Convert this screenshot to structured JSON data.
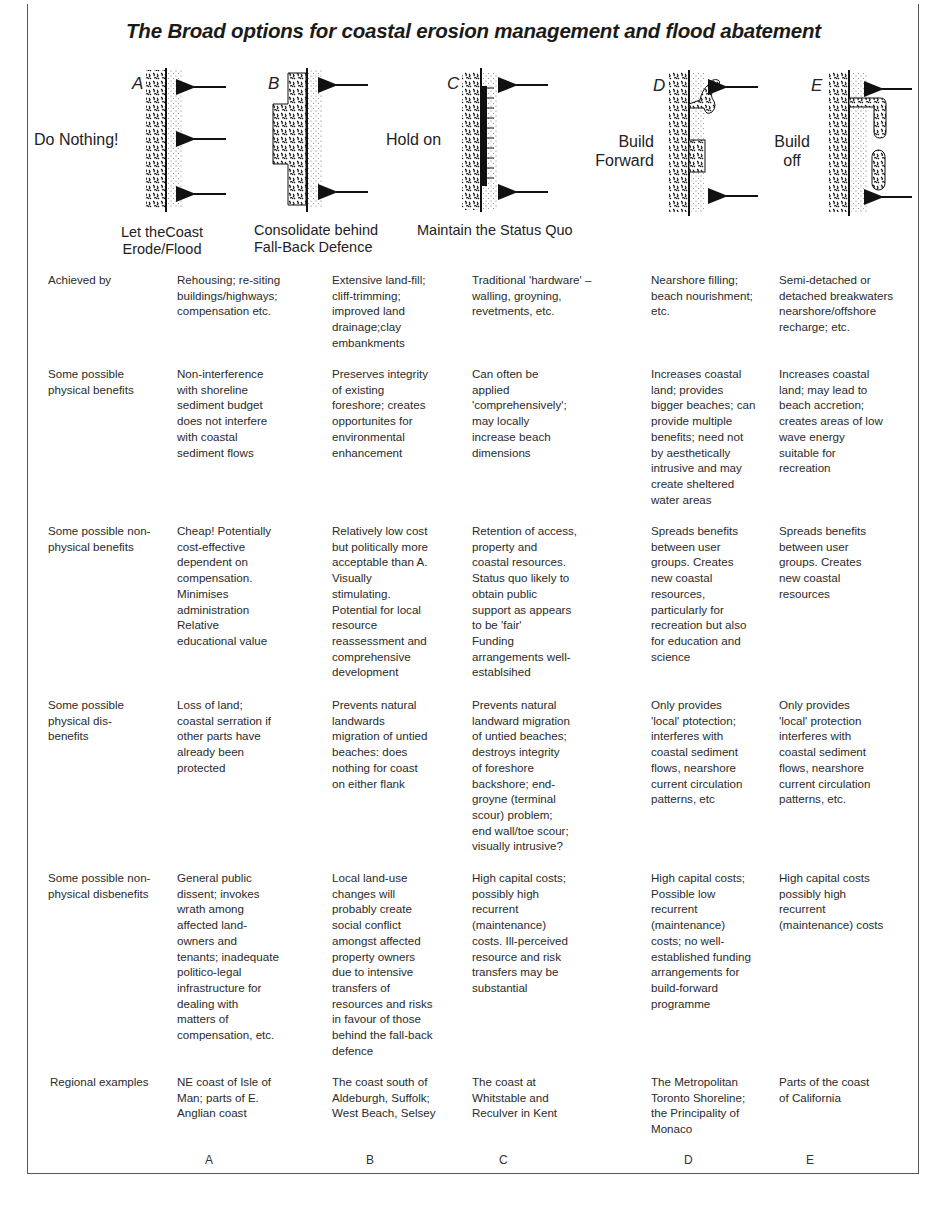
{
  "title": "The Broad options for coastal erosion management and flood abatement",
  "diagrams": [
    {
      "letter": "A",
      "side_label": "Do Nothing!",
      "caption": "Let theCoast\nErode/Flood"
    },
    {
      "letter": "B",
      "side_label": "",
      "caption": "Consolidate behind\nFall-Back Defence"
    },
    {
      "letter": "C",
      "side_label": "Hold on",
      "caption": "Maintain the Status Quo"
    },
    {
      "letter": "D",
      "side_label": "Build\nForward",
      "caption": ""
    },
    {
      "letter": "E",
      "side_label": "Build\noff",
      "caption": ""
    }
  ],
  "table": {
    "rows": [
      {
        "label": "Achieved by",
        "cells": [
          "Rehousing; re-siting\nbuildings/highways;\ncompensation etc.",
          "Extensive land-fill;\ncliff-trimming;\nimproved land\ndrainage;clay\nembankments",
          "Traditional 'hardware' –\nwalling, groyning,\nrevetments, etc.",
          "Nearshore filling;\nbeach nourishment;\netc.",
          "Semi-detached or\ndetached breakwaters\nnearshore/offshore\nrecharge; etc."
        ]
      },
      {
        "label": "Some possible\nphysical benefits",
        "cells": [
          "Non-interference\nwith shoreline\nsediment budget\ndoes not interfere\nwith coastal\nsediment flows",
          "Preserves integrity\nof existing\nforeshore; creates\nopportunites for\nenvironmental\nenhancement",
          "Can often be\napplied\n'comprehensively';\nmay locally\nincrease beach\ndimensions",
          "Increases coastal\nland; provides\nbigger beaches; can\nprovide multiple\nbenefits; need not\nby aesthetically\nintrusive and may\ncreate sheltered\nwater areas",
          "Increases coastal\nland; may lead to\nbeach accretion;\ncreates areas of  low\nwave energy\nsuitable for\nrecreation"
        ]
      },
      {
        "label": "Some possible non-\nphysical benefits",
        "cells": [
          "Cheap! Potentially\ncost-effective\ndependent on\ncompensation.\nMinimises\nadministration\nRelative\neducational value",
          "Relatively low cost\nbut politically more\nacceptable than A.\nVisually\nstimulating.\nPotential for local\nresource\nreassessment and\ncomprehensive\ndevelopment",
          "Retention of access,\nproperty and\ncoastal resources.\nStatus quo likely to\nobtain public\nsupport as appears\nto be 'fair'\nFunding\narrangements well-\nestablsihed",
          "Spreads benefits\nbetween user\ngroups. Creates\nnew coastal\nresources,\nparticularly for\nrecreation but also\nfor education and\nscience",
          "Spreads benefits\nbetween user\ngroups. Creates\nnew coastal\nresources"
        ]
      },
      {
        "label": "Some possible\nphysical dis-\nbenefits",
        "cells": [
          "Loss of land;\ncoastal serration if\nother parts have\nalready been\nprotected",
          "Prevents natural\nlandwards\nmigration of untied\nbeaches: does\nnothing for coast\non either flank",
          "Prevents natural\nlandward migration\nof untied beaches;\ndestroys integrity\nof foreshore\nbackshore; end-\ngroyne (terminal\nscour) problem;\nend wall/toe scour;\nvisually intrusive?",
          "Only provides\n'local' ptotection;\ninterferes with\ncoastal sediment\nflows, nearshore\ncurrent circulation\npatterns, etc",
          "Only provides\n'local' protection\ninterferes with\ncoastal sediment\nflows, nearshore\ncurrent circulation\npatterns, etc."
        ]
      },
      {
        "label": "Some possible non-\nphysical disbenefits",
        "cells": [
          "General public\ndissent; invokes\nwrath among\naffected land-\nowners and\ntenants; inadequate\npolitico-legal\ninfrastructure for\ndealing with\nmatters of\ncompensation, etc.",
          "Local land-use\nchanges will\nprobably create\nsocial conflict\namongst affected\nproperty owners\ndue to intensive\ntransfers of\nresources and risks\nin favour of those\nbehind the fall-back\ndefence",
          "High capital costs;\npossibly high\nrecurrent\n(maintenance)\ncosts. Ill-perceived\nresource and risk\ntransfers may be\nsubstantial",
          "High capital costs;\nPossible low\nrecurrent\n(maintenance)\ncosts; no well-\nestablished funding\narrangements for\nbuild-forward\nprogramme",
          "High capital costs\npossibly high\nrecurrent\n(maintenance) costs"
        ]
      },
      {
        "label": "Regional examples",
        "cells": [
          "NE coast of Isle of\nMan; parts of E.\nAnglian coast",
          "The coast south of\nAldeburgh, Suffolk;\nWest Beach, Selsey",
          "The coast  at\nWhitstable and\nReculver in Kent",
          "The Metropolitan\nToronto Shoreline;\nthe Principality of\nMonaco",
          "Parts of the coast\nof California"
        ]
      }
    ],
    "column_letters": [
      "A",
      "B",
      "C",
      "D",
      "E"
    ]
  },
  "colors": {
    "text": "#1a1a1a",
    "frame": "#555555",
    "ink": "#111111"
  }
}
